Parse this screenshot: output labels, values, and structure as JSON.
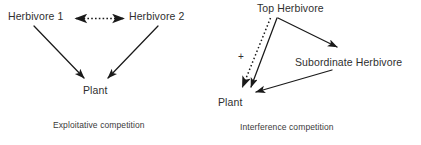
{
  "figure": {
    "background_color": "#ffffff",
    "stroke_color": "#1a1a1a",
    "text_color": "#2f2f2f"
  },
  "panels": [
    {
      "id": "exploitative",
      "caption": "Exploitative competition",
      "nodes": [
        {
          "id": "herbivore-1",
          "label": "Herbivore 1"
        },
        {
          "id": "herbivore-2",
          "label": "Herbivore 2"
        },
        {
          "id": "plant",
          "label": "Plant"
        }
      ],
      "edges": [
        {
          "from": "herbivore-1",
          "to": "herbivore-2",
          "style": "dotted",
          "heads": "both"
        },
        {
          "from": "herbivore-1",
          "to": "plant",
          "style": "solid",
          "heads": "end"
        },
        {
          "from": "herbivore-2",
          "to": "plant",
          "style": "solid",
          "heads": "end"
        }
      ]
    },
    {
      "id": "interference",
      "caption": "Interference competition",
      "nodes": [
        {
          "id": "top-herbivore",
          "label": "Top Herbivore"
        },
        {
          "id": "subordinate-herbivore",
          "label": "Subordinate Herbivore"
        },
        {
          "id": "plant",
          "label": "Plant"
        }
      ],
      "annotations": [
        {
          "id": "plus-sign",
          "label": "+"
        }
      ],
      "edges": [
        {
          "from": "top-herbivore",
          "to": "plant",
          "style": "dotted",
          "heads": "end",
          "sign": "+"
        },
        {
          "from": "top-herbivore",
          "to": "plant",
          "style": "solid",
          "heads": "end"
        },
        {
          "from": "top-herbivore",
          "to": "subordinate-herbivore",
          "style": "solid",
          "heads": "end"
        },
        {
          "from": "subordinate-herbivore",
          "to": "plant",
          "style": "solid",
          "heads": "end"
        }
      ]
    }
  ]
}
